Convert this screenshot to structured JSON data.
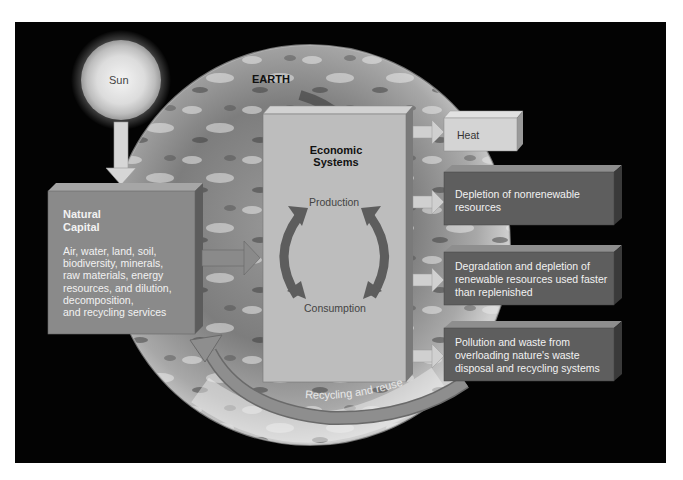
{
  "diagram": {
    "sun": {
      "label": "Sun"
    },
    "earth": {
      "label": "EARTH"
    },
    "natural_capital": {
      "title_line1": "Natural",
      "title_line2": "Capital",
      "lines": [
        "Air, water, land, soil,",
        "biodiversity, minerals,",
        "raw materials, energy",
        "resources, and dilution,",
        "decomposition,",
        "and recycling services"
      ]
    },
    "economic_systems": {
      "title_line1": "Economic",
      "title_line2": "Systems",
      "production": "Production",
      "consumption": "Consumption"
    },
    "outputs": [
      {
        "lines": [
          "Heat"
        ]
      },
      {
        "lines": [
          "Depletion of nonrenewable",
          "resources"
        ]
      },
      {
        "lines": [
          "Degradation and  depletion of",
          "renewable resources used faster",
          "than replenished"
        ]
      },
      {
        "lines": [
          "Pollution and waste from",
          "overloading  nature's waste",
          "disposal  and recycling systems"
        ]
      }
    ],
    "recycling": {
      "label": "Recycling and reuse"
    },
    "colors": {
      "background": "#030303",
      "box_gray": "#8a8a8a",
      "box_light": "#c4c4c4",
      "box_dark": "#5a5a5a",
      "arrow": "#7a7a7a",
      "arrow_light": "#cfcfcf"
    }
  }
}
